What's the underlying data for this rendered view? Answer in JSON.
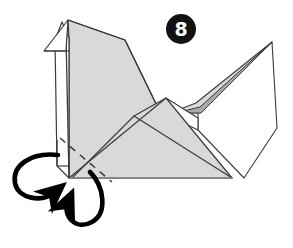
{
  "figure": {
    "step_number": "8",
    "background_color": "#ffffff",
    "outline_color": "#3b3b3b",
    "paper_front_color": "#d9d9d9",
    "paper_shadow_color": "#a9a9a9",
    "paper_back_color": "#ffffff",
    "arrow_color": "#000000",
    "fold_line_color": "#3b3b3b"
  },
  "step_badge": {
    "label": "8",
    "shape": "filled-circle",
    "background_color": "#121212",
    "text_color": "#ffffff"
  },
  "parts": {
    "head_beak": "white triangular beak at upper left",
    "neck": "narrow vertical strip below the beak",
    "body": "large light gray quadrilateral body",
    "wing": "light gray triangular wing across the body center",
    "tail": "gray spike pointing up to the right with darker shadow wedge",
    "back_panel": "white panel behind the tail on the right",
    "base": "horizontal bottom edge of the model"
  },
  "annotations": {
    "fold_line_style": "dashed",
    "fold_line_label": "valley fold line near the lower left leg",
    "arrows": [
      {
        "name": "inside-reverse-fold-arrow-left",
        "style": "curved loop with solid arrowhead",
        "direction": "loops counter-clockwise and points up-right toward the lower left corner"
      },
      {
        "name": "inside-reverse-fold-arrow-lower",
        "style": "curved loop with solid arrowhead",
        "direction": "loops clockwise downward and points up-left toward the base corner"
      }
    ]
  }
}
